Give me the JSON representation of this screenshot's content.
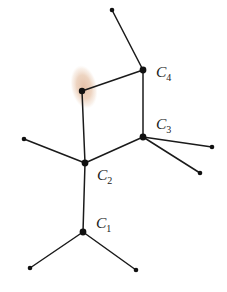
{
  "figure": {
    "kind": "molecular-skeleton-diagram",
    "width": 227,
    "height": 292,
    "background_color": "#ffffff",
    "bond_color": "#1a1a1a",
    "vertex_color": "#111111",
    "highlight_color": "#e3bb9e",
    "highlight_color_core": "#dfb395"
  },
  "labels": [
    {
      "id": "label-c1",
      "base": "C",
      "subscript": "1",
      "x": 96,
      "y": 228
    },
    {
      "id": "label-c2",
      "base": "C",
      "subscript": "2",
      "x": 97,
      "y": 180
    },
    {
      "id": "label-c3",
      "base": "C",
      "subscript": "3",
      "x": 156,
      "y": 129
    },
    {
      "id": "label-c4",
      "base": "C",
      "subscript": "4",
      "x": 156,
      "y": 77
    }
  ],
  "highlight": {
    "id": "highlighted-atom-marker",
    "cx": 84,
    "cy": 87,
    "rx": 13,
    "ry": 22,
    "rotation": -12,
    "opacity": 0.85
  },
  "vertices": [
    {
      "id": "vertex-c1",
      "x": 83,
      "y": 232,
      "r": 3.4,
      "labeled": "C1"
    },
    {
      "id": "vertex-c2",
      "x": 85,
      "y": 163,
      "r": 3.4,
      "labeled": "C2"
    },
    {
      "id": "vertex-c3",
      "x": 143,
      "y": 137,
      "r": 3.4,
      "labeled": "C3"
    },
    {
      "id": "vertex-c4",
      "x": 143,
      "y": 70,
      "r": 3.4,
      "labeled": "C4"
    },
    {
      "id": "vertex-highlighted",
      "x": 82,
      "y": 91,
      "r": 3.2,
      "labeled": ""
    },
    {
      "id": "terminal-top",
      "x": 112,
      "y": 10,
      "r": 2.3,
      "labeled": ""
    },
    {
      "id": "terminal-left-mid",
      "x": 24,
      "y": 139,
      "r": 2.3,
      "labeled": ""
    },
    {
      "id": "terminal-right-up",
      "x": 212,
      "y": 147,
      "r": 2.3,
      "labeled": ""
    },
    {
      "id": "terminal-right-low",
      "x": 200,
      "y": 173,
      "r": 2.3,
      "labeled": ""
    },
    {
      "id": "terminal-bot-left",
      "x": 30,
      "y": 268,
      "r": 2.3,
      "labeled": ""
    },
    {
      "id": "terminal-bot-right",
      "x": 136,
      "y": 270,
      "r": 2.3,
      "labeled": ""
    }
  ],
  "bonds": [
    {
      "id": "bond-c4-terminal-top",
      "x1": 143,
      "y1": 70,
      "x2": 112,
      "y2": 10,
      "width": 1.5
    },
    {
      "id": "bond-highlighted-c4",
      "x1": 82,
      "y1": 91,
      "x2": 143,
      "y2": 70,
      "width": 1.5
    },
    {
      "id": "bond-c4-c3",
      "x1": 143,
      "y1": 70,
      "x2": 143,
      "y2": 137,
      "width": 1.5
    },
    {
      "id": "bond-c3-c2",
      "x1": 143,
      "y1": 137,
      "x2": 85,
      "y2": 163,
      "width": 1.5
    },
    {
      "id": "bond-c2-highlighted",
      "x1": 85,
      "y1": 163,
      "x2": 82,
      "y2": 91,
      "width": 1.5
    },
    {
      "id": "bond-c3-terminal-right-up",
      "x1": 143,
      "y1": 137,
      "x2": 212,
      "y2": 147,
      "width": 1.5
    },
    {
      "id": "bond-c3-terminal-right-low",
      "x1": 143,
      "y1": 137,
      "x2": 200,
      "y2": 173,
      "width": 1.5
    },
    {
      "id": "bond-c2-terminal-left-mid",
      "x1": 85,
      "y1": 163,
      "x2": 24,
      "y2": 139,
      "width": 1.5
    },
    {
      "id": "bond-c2-c1",
      "x1": 85,
      "y1": 163,
      "x2": 83,
      "y2": 232,
      "width": 1.5
    },
    {
      "id": "bond-c1-terminal-bot-left",
      "x1": 83,
      "y1": 232,
      "x2": 30,
      "y2": 268,
      "width": 1.5
    },
    {
      "id": "bond-c1-terminal-bot-right",
      "x1": 83,
      "y1": 232,
      "x2": 136,
      "y2": 270,
      "width": 1.5
    }
  ]
}
